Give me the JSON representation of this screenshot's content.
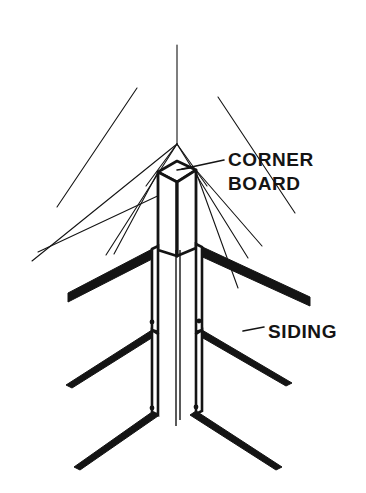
{
  "figure": {
    "kind": "technical-line-drawing",
    "background_color": "#ffffff",
    "ink_color": "#141414",
    "width": 366,
    "height": 493
  },
  "labels": {
    "corner_board": {
      "line1": "CORNER",
      "line2": "BOARD",
      "x": 228,
      "y": 166
    },
    "siding": {
      "text": "SIDING",
      "x": 268,
      "y": 331
    }
  },
  "geometry": {
    "center_x": 177,
    "apex_y": 143,
    "ridge_top_y": 45,
    "center_line_bottom_y": 426,
    "board_top_y": 168,
    "board_bottom_y": 250,
    "board_half_width": 19,
    "nails": [
      {
        "cx": 152,
        "cy": 322,
        "r": 2.4
      },
      {
        "cx": 199,
        "cy": 321,
        "r": 2.4
      },
      {
        "cx": 152,
        "cy": 408,
        "r": 2.4
      },
      {
        "cx": 196,
        "cy": 407,
        "r": 2.4
      }
    ]
  },
  "strokes": {
    "thin_width": 1.1,
    "medium_width": 2.0,
    "thick_width": 3.4
  }
}
